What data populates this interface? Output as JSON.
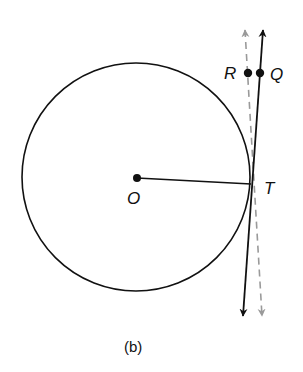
{
  "figure": {
    "caption": "(b)",
    "labels": {
      "center": "O",
      "tangent_point": "T",
      "point_r": "R",
      "point_q": "Q"
    },
    "colors": {
      "ink": "#111111",
      "dashed_line": "#9a9a9a"
    },
    "elements": [
      {
        "type": "circle",
        "center": "O",
        "description": "circle with center O"
      },
      {
        "type": "segment",
        "from": "O",
        "to": "T",
        "description": "radius OT"
      },
      {
        "type": "line",
        "style": "solid",
        "through": [
          "Q",
          "T"
        ],
        "description": "solid line tangent to circle at T, arrows both ends"
      },
      {
        "type": "line",
        "style": "dashed",
        "through": [
          "R"
        ],
        "description": "gray dashed line, arrows both ends"
      },
      {
        "type": "point",
        "name": "R"
      },
      {
        "type": "point",
        "name": "Q"
      }
    ]
  }
}
